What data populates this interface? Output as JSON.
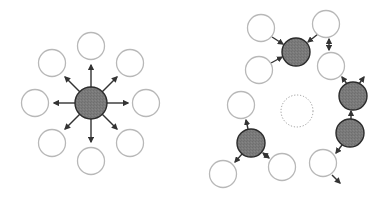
{
  "colors": {
    "background": "#ffffff",
    "dark_fill": "#7a7a7a",
    "dark_stroke": "#2b2b2b",
    "light_stroke": "#b8b8b8",
    "arrow": "#333333",
    "dotted": "#9a9a9a"
  },
  "left_panel": {
    "hub": {
      "cx": 91,
      "cy": 103,
      "r": 16
    },
    "satellites": [
      {
        "cx": 91,
        "cy": 46,
        "r": 13.5
      },
      {
        "cx": 130,
        "cy": 63,
        "r": 13.5
      },
      {
        "cx": 146,
        "cy": 103,
        "r": 13.5
      },
      {
        "cx": 130,
        "cy": 143,
        "r": 13.5
      },
      {
        "cx": 91,
        "cy": 161,
        "r": 13.5
      },
      {
        "cx": 52,
        "cy": 143,
        "r": 13.5
      },
      {
        "cx": 35,
        "cy": 103,
        "r": 13.5
      },
      {
        "cx": 52,
        "cy": 63,
        "r": 13.5
      }
    ],
    "arrows": [
      {
        "x1": 91,
        "y1": 87,
        "x2": 91,
        "y2": 65
      },
      {
        "x1": 102,
        "y1": 92,
        "x2": 117,
        "y2": 77
      },
      {
        "x1": 107,
        "y1": 103,
        "x2": 128,
        "y2": 103
      },
      {
        "x1": 102,
        "y1": 114,
        "x2": 117,
        "y2": 129
      },
      {
        "x1": 91,
        "y1": 119,
        "x2": 91,
        "y2": 142
      },
      {
        "x1": 80,
        "y1": 114,
        "x2": 65,
        "y2": 129
      },
      {
        "x1": 75,
        "y1": 103,
        "x2": 54,
        "y2": 103
      },
      {
        "x1": 80,
        "y1": 92,
        "x2": 65,
        "y2": 77
      }
    ]
  },
  "right_panel": {
    "center_placeholder": {
      "cx": 297,
      "cy": 111,
      "r": 16
    },
    "dark_nodes": [
      {
        "cx": 296,
        "cy": 52,
        "r": 14
      },
      {
        "cx": 353,
        "cy": 96,
        "r": 14
      },
      {
        "cx": 350,
        "cy": 133,
        "r": 14
      },
      {
        "cx": 251,
        "cy": 143,
        "r": 14
      }
    ],
    "light_nodes": [
      {
        "cx": 261,
        "cy": 28,
        "r": 13.5
      },
      {
        "cx": 259,
        "cy": 70,
        "r": 13.5
      },
      {
        "cx": 326,
        "cy": 24,
        "r": 13.5
      },
      {
        "cx": 331,
        "cy": 66,
        "r": 13.5
      },
      {
        "cx": 241,
        "cy": 105,
        "r": 13.5
      },
      {
        "cx": 223,
        "cy": 174,
        "r": 13.5
      },
      {
        "cx": 282,
        "cy": 167,
        "r": 13.5
      },
      {
        "cx": 323,
        "cy": 163,
        "r": 13.5
      }
    ],
    "arrows": [
      {
        "x1": 272,
        "y1": 37,
        "x2": 283,
        "y2": 44,
        "double": false
      },
      {
        "x1": 271,
        "y1": 63,
        "x2": 282,
        "y2": 57,
        "double": false
      },
      {
        "x1": 318,
        "y1": 34,
        "x2": 308,
        "y2": 42,
        "double": false
      },
      {
        "x1": 329,
        "y1": 39,
        "x2": 329,
        "y2": 50,
        "double": true
      },
      {
        "x1": 347,
        "y1": 84,
        "x2": 342,
        "y2": 77,
        "double": false
      },
      {
        "x1": 359,
        "y1": 84,
        "x2": 364,
        "y2": 77,
        "double": false
      },
      {
        "x1": 351,
        "y1": 119,
        "x2": 351,
        "y2": 111,
        "double": false
      },
      {
        "x1": 342,
        "y1": 145,
        "x2": 336,
        "y2": 153,
        "double": false
      },
      {
        "x1": 332,
        "y1": 175,
        "x2": 340,
        "y2": 183,
        "double": false
      },
      {
        "x1": 248,
        "y1": 129,
        "x2": 246,
        "y2": 120,
        "double": false
      },
      {
        "x1": 242,
        "y1": 154,
        "x2": 235,
        "y2": 162,
        "double": false
      },
      {
        "x1": 263,
        "y1": 153,
        "x2": 269,
        "y2": 158,
        "double": true
      }
    ]
  }
}
